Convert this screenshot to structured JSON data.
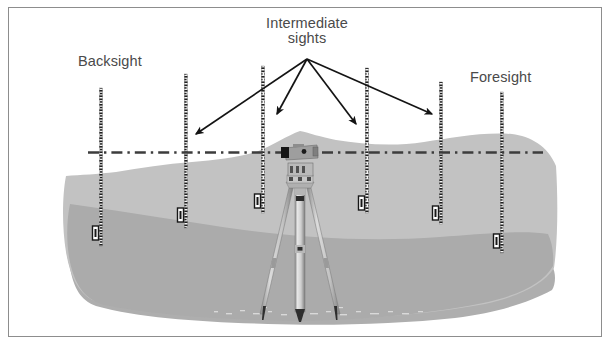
{
  "figure": {
    "kind": "surveying-levelling-diagram",
    "labels": {
      "backsight": "Backsight",
      "intermediate_line1": "Intermediate",
      "intermediate_line2": "sights",
      "foresight": "Foresight"
    },
    "colors": {
      "background": "#ffffff",
      "frame_border": "#8d8d8d",
      "text": "#4a4a4a",
      "ground_upper": "#bfbfbf",
      "ground_lower": "#a8a8a8",
      "ground_shadow": "#b4b4b4",
      "sight_line": "#3a3a3a",
      "arrow": "#1a1a1a",
      "staff_dark": "#1f1f1f",
      "staff_light": "#f2f2f2",
      "instrument_body": "#9a9a9a",
      "instrument_dark": "#1c1c1c",
      "tripod_leg": "#d2d2d2",
      "tripod_leg_edge": "#7a7a7a"
    },
    "sight_line": {
      "style": "dash-dot",
      "y": 152,
      "x_start": 88,
      "x_end": 543
    },
    "arrows": {
      "origin": {
        "x": 307,
        "y": 58
      },
      "tips": [
        {
          "x": 194,
          "y": 136,
          "target": "staff-2"
        },
        {
          "x": 276,
          "y": 116,
          "target": "staff-3"
        },
        {
          "x": 357,
          "y": 126,
          "target": "staff-4"
        },
        {
          "x": 433,
          "y": 116,
          "target": "staff-5"
        }
      ]
    },
    "staves": [
      {
        "id": "staff-1",
        "role": "backsight",
        "x": 101,
        "top": 88,
        "bottom": 246
      },
      {
        "id": "staff-2",
        "role": "intermediate-sight",
        "x": 186,
        "top": 74,
        "bottom": 228
      },
      {
        "id": "staff-3",
        "role": "intermediate-sight",
        "x": 263,
        "top": 66,
        "bottom": 213
      },
      {
        "id": "staff-4",
        "role": "intermediate-sight",
        "x": 367,
        "top": 68,
        "bottom": 213
      },
      {
        "id": "staff-5",
        "role": "intermediate-sight",
        "x": 441,
        "top": 82,
        "bottom": 224
      },
      {
        "id": "staff-6",
        "role": "foresight",
        "x": 502,
        "top": 92,
        "bottom": 253
      }
    ],
    "instrument": {
      "name": "automatic-level-on-tripod",
      "x": 300,
      "head_y": 148,
      "foot_y": 316
    },
    "ground": {
      "upper_surface_note": "undulating lighter-grey terrain, highest under the instrument",
      "lower_surface_note": "darker grey band beneath the upper terrain",
      "x_left": 66,
      "x_right": 556
    }
  }
}
